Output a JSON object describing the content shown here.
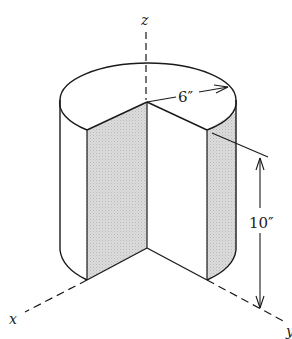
{
  "figure": {
    "type": "cylinder with sector removed, isometric view",
    "axes": {
      "z_label": "z",
      "x_label": "x",
      "y_label": "y"
    },
    "dimensions": {
      "radius_label": "6″",
      "height_label": "10″"
    },
    "colors": {
      "line": "#1a1a1a",
      "shaded_face": "#d6d6d6",
      "background": "#ffffff"
    }
  }
}
